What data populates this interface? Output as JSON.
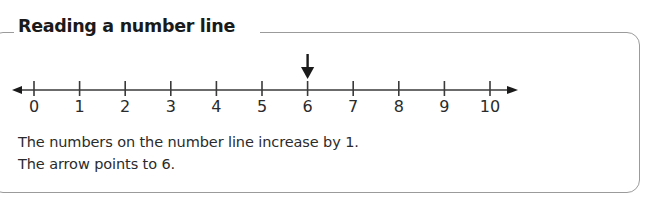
{
  "panel": {
    "title": "Reading a number line",
    "border_color": "#9b9b9b"
  },
  "number_line": {
    "line_color": "#3a3a3a",
    "arrow_marker_color": "#1a1a1a",
    "min": 0,
    "max": 10,
    "step": 1,
    "tick_labels": [
      "0",
      "1",
      "2",
      "3",
      "4",
      "5",
      "6",
      "7",
      "8",
      "9",
      "10"
    ],
    "left_arrowhead": true,
    "right_arrowhead": true,
    "pointer_value": 6,
    "pointer_label": "arrow pointing down at 6"
  },
  "caption": {
    "line1": "The numbers on the number line increase by 1.",
    "line2": "The arrow points to 6."
  }
}
